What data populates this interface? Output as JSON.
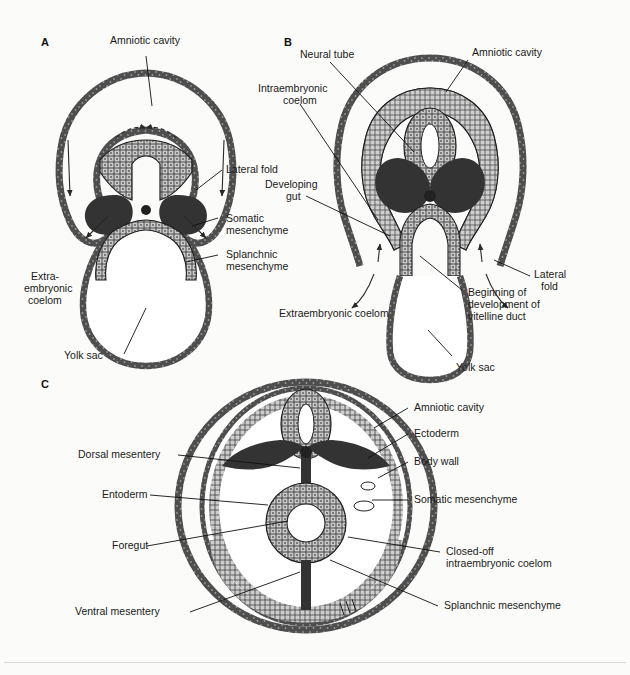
{
  "figure": {
    "background_color": "#fbfbf9",
    "ink_color": "#1a1a1a",
    "membrane_color": "#4a4a4a",
    "mesenchyme_color": "#3a3a3a",
    "epithelium_color": "#bdbdbd"
  },
  "panels": [
    {
      "id": "A",
      "letter": "A"
    },
    {
      "id": "B",
      "letter": "B"
    },
    {
      "id": "C",
      "letter": "C"
    }
  ],
  "labels": {
    "a": [
      {
        "name": "amniotic-cavity",
        "text": "Amniotic cavity"
      },
      {
        "name": "lateral-fold",
        "text": "Lateral fold"
      },
      {
        "name": "somatic-mesenchyme-1",
        "text": "Somatic"
      },
      {
        "name": "somatic-mesenchyme-2",
        "text": "mesenchyme"
      },
      {
        "name": "splanchnic-mesenchyme-1",
        "text": "Splanchnic"
      },
      {
        "name": "splanchnic-mesenchyme-2",
        "text": "mesenchyme"
      },
      {
        "name": "extraembryonic-coelom-1",
        "text": "Extra-"
      },
      {
        "name": "extraembryonic-coelom-2",
        "text": "embryonic"
      },
      {
        "name": "extraembryonic-coelom-3",
        "text": "coelom"
      },
      {
        "name": "yolk-sac",
        "text": "Yolk sac"
      }
    ],
    "b": [
      {
        "name": "neural-tube",
        "text": "Neural tube"
      },
      {
        "name": "amniotic-cavity",
        "text": "Amniotic cavity"
      },
      {
        "name": "intraembryonic-coelom-1",
        "text": "Intraembryonic"
      },
      {
        "name": "intraembryonic-coelom-2",
        "text": "coelom"
      },
      {
        "name": "developing-gut-1",
        "text": "Developing"
      },
      {
        "name": "developing-gut-2",
        "text": "gut"
      },
      {
        "name": "lateral-fold-1",
        "text": "Lateral"
      },
      {
        "name": "lateral-fold-2",
        "text": "fold"
      },
      {
        "name": "extraembryonic-coelom",
        "text": "Extraembryonic coelom"
      },
      {
        "name": "vitelline-duct-1",
        "text": "Beginning of"
      },
      {
        "name": "vitelline-duct-2",
        "text": "development of"
      },
      {
        "name": "vitelline-duct-3",
        "text": "vitelline duct"
      },
      {
        "name": "yolk-sac",
        "text": "Yolk sac"
      }
    ],
    "c": [
      {
        "name": "dorsal-mesentery",
        "text": "Dorsal mesentery"
      },
      {
        "name": "entoderm",
        "text": "Entoderm"
      },
      {
        "name": "foregut",
        "text": "Foregut"
      },
      {
        "name": "ventral-mesentery",
        "text": "Ventral mesentery"
      },
      {
        "name": "amniotic-cavity",
        "text": "Amniotic cavity"
      },
      {
        "name": "ectoderm",
        "text": "Ectoderm"
      },
      {
        "name": "body-wall",
        "text": "Body wall"
      },
      {
        "name": "somatic-mesenchyme",
        "text": "Somatic mesenchyme"
      },
      {
        "name": "closed-off-coelom-1",
        "text": "Closed-off"
      },
      {
        "name": "closed-off-coelom-2",
        "text": "intraembryonic coelom"
      },
      {
        "name": "splanchnic-mesenchyme",
        "text": "Splanchnic mesenchyme"
      }
    ]
  }
}
